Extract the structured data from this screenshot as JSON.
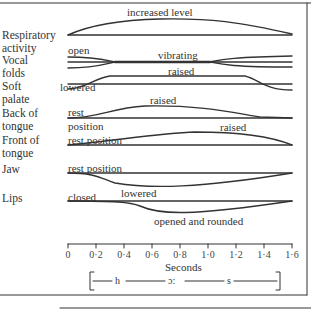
{
  "diagram": {
    "rows": [
      {
        "label": "Respiratory\nactivity",
        "label_lines": [
          "Respiratory",
          "activity"
        ],
        "annotations": [
          "increased level"
        ]
      },
      {
        "label": "Vocal\nfolds",
        "label_lines": [
          "Vocal",
          "folds"
        ],
        "annotations": [
          "open",
          "vibrating"
        ]
      },
      {
        "label": "Soft\npalate",
        "label_lines": [
          "Soft",
          "palate"
        ],
        "annotations": [
          "lowered",
          "raised"
        ]
      },
      {
        "label": "Back of\ntongue",
        "label_lines": [
          "Back of",
          "tongue"
        ],
        "annotations": [
          "rest",
          "position",
          "raised"
        ]
      },
      {
        "label": "Front of\ntongue",
        "label_lines": [
          "Front of",
          "tongue"
        ],
        "annotations": [
          "rest position",
          "raised"
        ]
      },
      {
        "label": "Jaw",
        "label_lines": [
          "Jaw"
        ],
        "annotations": [
          "rest position",
          "lowered"
        ]
      },
      {
        "label": "Lips",
        "label_lines": [
          "Lips"
        ],
        "annotations": [
          "closed",
          "opened and rounded"
        ]
      }
    ],
    "axis": {
      "title": "Seconds",
      "ticks": [
        "0",
        "0·2",
        "0·4",
        "0·6",
        "0·8",
        "1·0",
        "1·2",
        "1·4",
        "1·6"
      ],
      "range": [
        0,
        1.6
      ]
    },
    "segments": {
      "open_bracket": "[",
      "close_bracket": "]",
      "phones": [
        "h",
        "ɔ:",
        "s"
      ]
    }
  }
}
